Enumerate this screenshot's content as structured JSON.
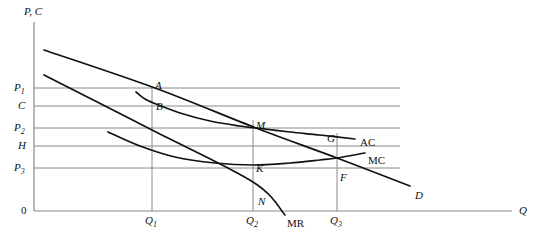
{
  "figure": {
    "background_color": "#ffffff",
    "axis_color": "#8a8a8a",
    "gridline_color": "#8a8a8a",
    "curve_color": "#111111",
    "label_color": "#111111"
  },
  "axes": {
    "y_label": "P, C",
    "x_label": "Q",
    "origin_label": "0",
    "origin": {
      "x": 34,
      "y": 211
    },
    "x_axis_end": {
      "x": 512,
      "y": 211
    },
    "y_axis_top": {
      "x": 34,
      "y": 22
    }
  },
  "y_ticks": [
    {
      "label": "P",
      "sub": "1",
      "y": 88
    },
    {
      "label": "C",
      "sub": "",
      "y": 106
    },
    {
      "label": "P",
      "sub": "2",
      "y": 128
    },
    {
      "label": "H",
      "sub": "",
      "y": 146
    },
    {
      "label": "P",
      "sub": "3",
      "y": 168
    }
  ],
  "x_ticks": [
    {
      "label": "Q",
      "sub": "1",
      "x": 152
    },
    {
      "label": "Q",
      "sub": "2",
      "x": 253
    },
    {
      "label": "Q",
      "sub": "3",
      "x": 337
    }
  ],
  "curve_labels": [
    {
      "name": "AC",
      "text": "AC",
      "x": 360,
      "y": 137,
      "italic": false
    },
    {
      "name": "MC",
      "text": "MC",
      "x": 368,
      "y": 155,
      "italic": false
    },
    {
      "name": "MR",
      "text": "MR",
      "x": 287,
      "y": 218,
      "italic": false
    },
    {
      "name": "D",
      "text": "D",
      "x": 415,
      "y": 190,
      "italic": true
    }
  ],
  "points": [
    {
      "name": "A",
      "text": "A",
      "x": 155,
      "y": 80
    },
    {
      "name": "B",
      "text": "B",
      "x": 156,
      "y": 101
    },
    {
      "name": "M",
      "text": "M",
      "x": 256,
      "y": 120
    },
    {
      "name": "K",
      "text": "K",
      "x": 256,
      "y": 163
    },
    {
      "name": "N",
      "text": "N",
      "x": 258,
      "y": 196
    },
    {
      "name": "G",
      "text": "G",
      "x": 327,
      "y": 133
    },
    {
      "name": "F",
      "text": "F",
      "x": 340,
      "y": 172
    }
  ],
  "chart_data": {
    "type": "line",
    "xlabel": "Q",
    "ylabel": "P, C",
    "grid": true,
    "legend_position": "inline-curve-labels",
    "axis_ranges": {
      "x_pixels": [
        34,
        512
      ],
      "y_pixels": [
        22,
        211
      ]
    },
    "series": [
      {
        "name": "D",
        "label": "D",
        "description": "Firm demand (average revenue) curve, downward sloping straight line",
        "points": [
          [
            44,
            50
          ],
          [
            155,
            88
          ],
          [
            256,
            128
          ],
          [
            337,
            158
          ],
          [
            410,
            186
          ]
        ]
      },
      {
        "name": "MR",
        "label": "MR",
        "description": "Marginal revenue line, steeper downward sloping straight line",
        "points": [
          [
            44,
            75
          ],
          [
            152,
            130
          ],
          [
            253,
            182
          ],
          [
            285,
            215
          ]
        ]
      },
      {
        "name": "AC",
        "label": "AC",
        "description": "Average cost curve, U-shaped, tangent to demand at M",
        "points": [
          [
            136,
            92
          ],
          [
            145,
            99
          ],
          [
            156,
            104
          ],
          [
            180,
            113
          ],
          [
            210,
            121
          ],
          [
            240,
            126
          ],
          [
            256,
            128
          ],
          [
            290,
            132
          ],
          [
            320,
            135
          ],
          [
            355,
            139
          ]
        ]
      },
      {
        "name": "MC",
        "label": "MC",
        "description": "Marginal cost curve, falls then rises, cuts AC and D near F",
        "points": [
          [
            108,
            132
          ],
          [
            140,
            146
          ],
          [
            175,
            157
          ],
          [
            215,
            163
          ],
          [
            253,
            165
          ],
          [
            290,
            163
          ],
          [
            320,
            160
          ],
          [
            337,
            158
          ],
          [
            365,
            153
          ]
        ]
      }
    ],
    "annotated_points": [
      {
        "label": "A",
        "x_tick": "Q1",
        "y_tick": "P1",
        "on": "D"
      },
      {
        "label": "B",
        "x_tick": "Q1",
        "y_tick": "C",
        "on": "AC"
      },
      {
        "label": "M",
        "x_tick": "Q2",
        "y_tick": "P2",
        "on": "D and AC tangency"
      },
      {
        "label": "K",
        "x_tick": "Q2",
        "y_tick": "H",
        "on": "MC"
      },
      {
        "label": "N",
        "x_tick": "Q2",
        "y_tick": "",
        "on": "MR"
      },
      {
        "label": "G",
        "x_tick": "Q3",
        "y_tick": "",
        "on": "AC"
      },
      {
        "label": "F",
        "x_tick": "Q3",
        "y_tick": "P3",
        "on": "MC and D"
      }
    ]
  }
}
